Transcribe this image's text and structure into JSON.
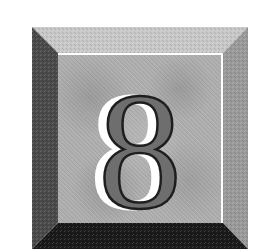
{
  "badge": {
    "digit": "8",
    "colors": {
      "background": "#ffffff",
      "bevel_top": "#c8c8c8",
      "bevel_left": "#4a4a4a",
      "bevel_right": "#9a9a9a",
      "bevel_bottom": "#1a1a1a",
      "panel": "#adadad",
      "digit_fill": "#6e6e6e",
      "digit_outline": "#1e1e1e",
      "digit_highlight": "#ffffff"
    }
  }
}
